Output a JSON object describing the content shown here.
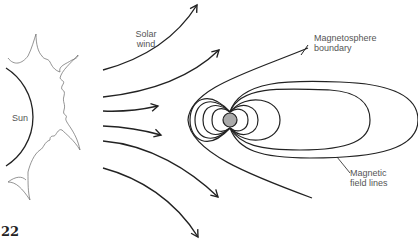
{
  "diagram": {
    "labels": {
      "sun": "Sun",
      "solar_wind_line1": "Solar",
      "solar_wind_line2": "wind",
      "magnetosphere_line1": "Magnetosphere",
      "magnetosphere_line2": "boundary",
      "field_lines_line1": "Magnetic",
      "field_lines_line2": "field lines"
    },
    "page_number": "22",
    "elements": [
      "sun",
      "corona",
      "solar-wind-arrows (6)",
      "earth",
      "magnetic-field-lines",
      "magnetosphere-boundary"
    ],
    "colors": {
      "line": "#222222",
      "earth": "#aaaaaa",
      "text": "#555555"
    }
  }
}
